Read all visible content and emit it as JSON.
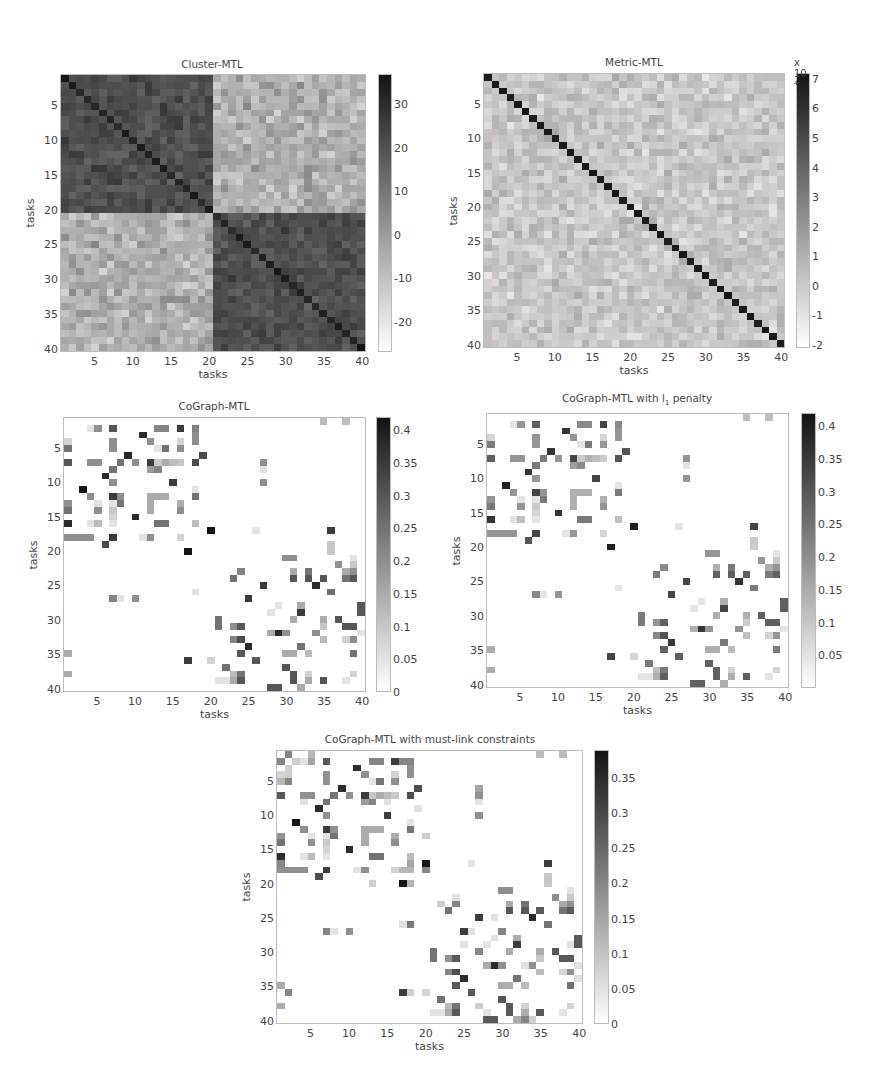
{
  "chart_data": [
    {
      "id": "cluster",
      "type": "heatmap",
      "title": "Cluster-MTL",
      "xlabel": "tasks",
      "ylabel": "tasks",
      "size": 40,
      "x_ticks": [
        5,
        10,
        15,
        20,
        25,
        30,
        35,
        40
      ],
      "y_ticks": [
        5,
        10,
        15,
        20,
        25,
        30,
        35,
        40
      ],
      "colorbar": {
        "min": -27,
        "max": 37,
        "ticks": [
          30,
          20,
          10,
          0,
          -10,
          -20
        ],
        "multiplier": ""
      },
      "colormap": "gray_r",
      "structure": "two 20x20 block clusters: tasks 1-20 and 21-40 strongly correlated within block (dark), weakly/negatively across blocks (light); darker diagonal"
    },
    {
      "id": "metric",
      "type": "heatmap",
      "title": "Metric-MTL",
      "xlabel": "tasks",
      "ylabel": "tasks",
      "size": 40,
      "x_ticks": [
        5,
        10,
        15,
        20,
        25,
        30,
        35,
        40
      ],
      "y_ticks": [
        5,
        10,
        15,
        20,
        25,
        30,
        35,
        40
      ],
      "colorbar": {
        "min": -2.1,
        "max": 7.2,
        "ticks": [
          7,
          6,
          5,
          4,
          3,
          2,
          1,
          0,
          -1,
          -2
        ],
        "multiplier": "x 10",
        "multiplier_exp": "4"
      },
      "colormap": "gray_r",
      "structure": "strong dark diagonal (~7e4), off-diagonal noisy values between about -1e4 and 1.5e4"
    },
    {
      "id": "cograph",
      "type": "heatmap",
      "title": "CoGraph-MTL",
      "xlabel": "tasks",
      "ylabel": "tasks",
      "size": 40,
      "x_ticks": [
        5,
        10,
        15,
        20,
        25,
        30,
        35,
        40
      ],
      "y_ticks": [
        5,
        10,
        15,
        20,
        25,
        30,
        35,
        40
      ],
      "colorbar": {
        "min": 0,
        "max": 0.42,
        "ticks": [
          0.4,
          0.35,
          0.3,
          0.25,
          0.2,
          0.15,
          0.1,
          0.05,
          0
        ],
        "multiplier": ""
      },
      "colormap": "gray_r",
      "entries": [
        [
          2,
          4,
          0.05
        ],
        [
          2,
          5,
          0.2
        ],
        [
          2,
          7,
          0.3
        ],
        [
          2,
          13,
          0.22
        ],
        [
          2,
          14,
          0.22
        ],
        [
          2,
          16,
          0.35
        ],
        [
          2,
          18,
          0.22
        ],
        [
          3,
          18,
          0.2
        ],
        [
          4,
          18,
          0.2
        ],
        [
          3,
          11,
          0.38
        ],
        [
          4,
          12,
          0.2
        ],
        [
          4,
          1,
          0.08
        ],
        [
          5,
          1,
          0.25
        ],
        [
          4,
          7,
          0.2
        ],
        [
          5,
          7,
          0.2
        ],
        [
          5,
          13,
          0.05
        ],
        [
          5,
          14,
          0.25
        ],
        [
          4,
          16,
          0.08
        ],
        [
          5,
          16,
          0.2
        ],
        [
          6,
          9,
          0.38
        ],
        [
          6,
          19,
          0.32
        ],
        [
          7,
          1,
          0.3
        ],
        [
          7,
          4,
          0.2
        ],
        [
          7,
          5,
          0.2
        ],
        [
          7,
          8,
          0.25
        ],
        [
          7,
          10,
          0.2
        ],
        [
          7,
          12,
          0.35
        ],
        [
          7,
          13,
          0.1
        ],
        [
          7,
          14,
          0.15
        ],
        [
          7,
          15,
          0.12
        ],
        [
          7,
          16,
          0.1
        ],
        [
          7,
          18,
          0.32
        ],
        [
          8,
          7,
          0.25
        ],
        [
          8,
          12,
          0.18
        ],
        [
          8,
          13,
          0.22
        ],
        [
          7,
          27,
          0.2
        ],
        [
          8,
          27,
          0.05
        ],
        [
          9,
          6,
          0.38
        ],
        [
          10,
          7,
          0.2
        ],
        [
          10,
          15,
          0.35
        ],
        [
          10,
          27,
          0.2
        ],
        [
          11,
          3,
          0.42
        ],
        [
          12,
          4,
          0.2
        ],
        [
          12,
          7,
          0.35
        ],
        [
          12,
          8,
          0.2
        ],
        [
          12,
          12,
          0.15
        ],
        [
          12,
          13,
          0.15
        ],
        [
          12,
          14,
          0.15
        ],
        [
          12,
          18,
          0.25
        ],
        [
          11,
          18,
          0.05
        ],
        [
          13,
          1,
          0.2
        ],
        [
          14,
          1,
          0.25
        ],
        [
          13,
          5,
          0.05
        ],
        [
          14,
          5,
          0.2
        ],
        [
          13,
          8,
          0.25
        ],
        [
          13,
          12,
          0.15
        ],
        [
          14,
          12,
          0.15
        ],
        [
          13,
          16,
          0.15
        ],
        [
          14,
          16,
          0.2
        ],
        [
          13,
          7,
          0.05
        ],
        [
          14,
          7,
          0.1
        ],
        [
          15,
          7,
          0.08
        ],
        [
          15,
          10,
          0.38
        ],
        [
          16,
          1,
          0.38
        ],
        [
          16,
          4,
          0.05
        ],
        [
          16,
          5,
          0.12
        ],
        [
          16,
          7,
          0.05
        ],
        [
          16,
          13,
          0.25
        ],
        [
          16,
          14,
          0.25
        ],
        [
          16,
          18,
          0.12
        ],
        [
          17,
          20,
          0.42
        ],
        [
          17,
          36,
          0.35
        ],
        [
          17,
          26,
          0.05
        ],
        [
          18,
          1,
          0.2
        ],
        [
          18,
          2,
          0.2
        ],
        [
          18,
          3,
          0.2
        ],
        [
          18,
          4,
          0.2
        ],
        [
          18,
          7,
          0.35
        ],
        [
          18,
          11,
          0.05
        ],
        [
          18,
          12,
          0.2
        ],
        [
          18,
          16,
          0.08
        ],
        [
          19,
          6,
          0.32
        ],
        [
          20,
          17,
          0.42
        ],
        [
          19,
          36,
          0.1
        ],
        [
          20,
          36,
          0.1
        ],
        [
          21,
          30,
          0.2
        ],
        [
          21,
          31,
          0.2
        ],
        [
          22,
          37,
          0.2
        ],
        [
          21,
          39,
          0.05
        ],
        [
          22,
          39,
          0.1
        ],
        [
          23,
          24,
          0.22
        ],
        [
          24,
          23,
          0.25
        ],
        [
          23,
          31,
          0.15
        ],
        [
          24,
          31,
          0.3
        ],
        [
          23,
          33,
          0.25
        ],
        [
          24,
          33,
          0.3
        ],
        [
          24,
          35,
          0.3
        ],
        [
          25,
          34,
          0.38
        ],
        [
          23,
          38,
          0.15
        ],
        [
          24,
          38,
          0.25
        ],
        [
          23,
          39,
          0.2
        ],
        [
          24,
          39,
          0.3
        ],
        [
          25,
          27,
          0.35
        ],
        [
          26,
          36,
          0.25
        ],
        [
          26,
          18,
          0.05
        ],
        [
          27,
          7,
          0.22
        ],
        [
          27,
          8,
          0.05
        ],
        [
          27,
          10,
          0.2
        ],
        [
          27,
          25,
          0.35
        ],
        [
          28,
          29,
          0.05
        ],
        [
          29,
          28,
          0.05
        ],
        [
          28,
          32,
          0.15
        ],
        [
          29,
          32,
          0.35
        ],
        [
          28,
          40,
          0.3
        ],
        [
          29,
          40,
          0.3
        ],
        [
          30,
          21,
          0.25
        ],
        [
          31,
          21,
          0.25
        ],
        [
          30,
          31,
          0.15
        ],
        [
          30,
          35,
          0.15
        ],
        [
          31,
          35,
          0.1
        ],
        [
          30,
          37,
          0.3
        ],
        [
          31,
          38,
          0.3
        ],
        [
          31,
          39,
          0.3
        ],
        [
          31,
          23,
          0.2
        ],
        [
          31,
          24,
          0.3
        ],
        [
          32,
          30,
          0.2
        ],
        [
          32,
          40,
          0.05
        ],
        [
          32,
          28,
          0.15
        ],
        [
          32,
          29,
          0.38
        ],
        [
          32,
          34,
          0.2
        ],
        [
          33,
          35,
          0.12
        ],
        [
          33,
          23,
          0.22
        ],
        [
          33,
          24,
          0.32
        ],
        [
          33,
          38,
          0.08
        ],
        [
          33,
          39,
          0.2
        ],
        [
          34,
          25,
          0.38
        ],
        [
          34,
          32,
          0.25
        ],
        [
          35,
          24,
          0.3
        ],
        [
          35,
          30,
          0.15
        ],
        [
          35,
          31,
          0.15
        ],
        [
          35,
          33,
          0.12
        ],
        [
          35,
          39,
          0.25
        ],
        [
          35,
          1,
          0.15
        ],
        [
          36,
          17,
          0.35
        ],
        [
          36,
          20,
          0.08
        ],
        [
          36,
          26,
          0.3
        ],
        [
          37,
          22,
          0.25
        ],
        [
          37,
          30,
          0.3
        ],
        [
          38,
          1,
          0.15
        ],
        [
          38,
          23,
          0.12
        ],
        [
          38,
          24,
          0.25
        ],
        [
          38,
          31,
          0.3
        ],
        [
          38,
          33,
          0.08
        ],
        [
          38,
          39,
          0.08
        ],
        [
          39,
          21,
          0.05
        ],
        [
          39,
          22,
          0.05
        ],
        [
          39,
          23,
          0.15
        ],
        [
          39,
          24,
          0.3
        ],
        [
          39,
          31,
          0.3
        ],
        [
          39,
          33,
          0.15
        ],
        [
          39,
          35,
          0.3
        ],
        [
          39,
          38,
          0.05
        ],
        [
          40,
          28,
          0.3
        ],
        [
          40,
          29,
          0.3
        ],
        [
          40,
          32,
          0.15
        ],
        [
          1,
          35,
          0.12
        ],
        [
          1,
          38,
          0.12
        ]
      ]
    },
    {
      "id": "cograph_l1",
      "type": "heatmap",
      "title": "CoGraph-MTL with l",
      "title_sub": "1",
      "title_suffix": " penalty",
      "xlabel": "tasks",
      "ylabel": "tasks",
      "size": 40,
      "x_ticks": [
        5,
        10,
        15,
        20,
        25,
        30,
        35,
        40
      ],
      "y_ticks": [
        5,
        10,
        15,
        20,
        25,
        30,
        35,
        40
      ],
      "colorbar": {
        "min": 0,
        "max": 0.42,
        "ticks": [
          0.4,
          0.35,
          0.3,
          0.25,
          0.2,
          0.15,
          0.1,
          0.05
        ],
        "multiplier": ""
      },
      "colormap": "gray_r",
      "entries_from": "cograph",
      "scale": 0.95
    },
    {
      "id": "cograph_ml",
      "type": "heatmap",
      "title": "CoGraph-MTL with must-link constraints",
      "xlabel": "tasks",
      "ylabel": "tasks",
      "size": 40,
      "x_ticks": [
        5,
        10,
        15,
        20,
        25,
        30,
        35,
        40
      ],
      "y_ticks": [
        5,
        10,
        15,
        20,
        25,
        30,
        35,
        40
      ],
      "colorbar": {
        "min": 0,
        "max": 0.39,
        "ticks": [
          0.35,
          0.3,
          0.25,
          0.2,
          0.15,
          0.1,
          0.05,
          0
        ],
        "multiplier": ""
      },
      "colormap": "gray_r",
      "entries_from": "cograph",
      "scale": 0.92,
      "extra_entries": [
        [
          1,
          2,
          0.2
        ],
        [
          2,
          1,
          0.2
        ],
        [
          1,
          5,
          0.12
        ],
        [
          2,
          5,
          0.15
        ],
        [
          2,
          3,
          0.08
        ],
        [
          2,
          17,
          0.2
        ],
        [
          3,
          2,
          0.08
        ],
        [
          4,
          2,
          0.08
        ],
        [
          5,
          2,
          0.2
        ],
        [
          5,
          1,
          0.12
        ],
        [
          6,
          27,
          0.15
        ],
        [
          8,
          4,
          0.05
        ],
        [
          8,
          15,
          0.05
        ],
        [
          9,
          19,
          0.05
        ],
        [
          13,
          20,
          0.08
        ],
        [
          17,
          1,
          0.2
        ],
        [
          17,
          18,
          0.15
        ],
        [
          18,
          18,
          0.12
        ],
        [
          18,
          17,
          0.12
        ],
        [
          18,
          20,
          0.2
        ],
        [
          20,
          18,
          0.12
        ],
        [
          20,
          13,
          0.08
        ],
        [
          22,
          24,
          0.05
        ],
        [
          23,
          22,
          0.08
        ],
        [
          25,
          29,
          0.05
        ],
        [
          26,
          17,
          0.05
        ],
        [
          26,
          18,
          0.22
        ],
        [
          27,
          26,
          0.05
        ],
        [
          27,
          30,
          0.2
        ],
        [
          29,
          25,
          0.05
        ],
        [
          30,
          27,
          0.2
        ],
        [
          29,
          39,
          0.05
        ],
        [
          32,
          33,
          0.05
        ],
        [
          34,
          40,
          0.05
        ],
        [
          36,
          2,
          0.2
        ],
        [
          36,
          18,
          0.08
        ],
        [
          38,
          27,
          0.08
        ],
        [
          39,
          28,
          0.05
        ],
        [
          40,
          34,
          0.08
        ],
        [
          40,
          33,
          0.2
        ]
      ]
    }
  ]
}
